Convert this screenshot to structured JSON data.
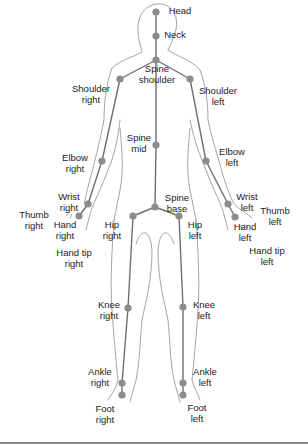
{
  "diagram": {
    "colors": {
      "joint": "#8c8c8c",
      "bone": "#6e6e6e",
      "outline": "#9a9a9a",
      "text": "#222222"
    },
    "joints": [
      {
        "id": "head",
        "label": "Head",
        "x": 156,
        "y": 12
      },
      {
        "id": "neck",
        "label": "Neck",
        "x": 156,
        "y": 36
      },
      {
        "id": "spine_shoulder",
        "label": "Spine\nshoulder",
        "x": 156,
        "y": 60
      },
      {
        "id": "shoulder_right",
        "label": "Shoulder\nright",
        "x": 120,
        "y": 79
      },
      {
        "id": "shoulder_left",
        "label": "Shoulder\nleft",
        "x": 190,
        "y": 79
      },
      {
        "id": "spine_mid",
        "label": "Spine\nmid",
        "x": 156,
        "y": 145
      },
      {
        "id": "elbow_right",
        "label": "Elbow\nright",
        "x": 102,
        "y": 161
      },
      {
        "id": "elbow_left",
        "label": "Elbow\nleft",
        "x": 206,
        "y": 161
      },
      {
        "id": "wrist_right",
        "label": "Wrist\nright",
        "x": 88,
        "y": 204
      },
      {
        "id": "wrist_left",
        "label": "Wrist\nleft",
        "x": 228,
        "y": 204
      },
      {
        "id": "hand_right",
        "label": "Hand\nright",
        "x": 79,
        "y": 216
      },
      {
        "id": "hand_left",
        "label": "Hand\nleft",
        "x": 235,
        "y": 217
      },
      {
        "id": "spine_base",
        "label": "Spine\nbase",
        "x": 155,
        "y": 207
      },
      {
        "id": "hip_right",
        "label": "Hip\nright",
        "x": 133,
        "y": 216
      },
      {
        "id": "hip_left",
        "label": "Hip\nleft",
        "x": 179,
        "y": 216
      },
      {
        "id": "knee_right",
        "label": "Knee\nright",
        "x": 128,
        "y": 308
      },
      {
        "id": "knee_left",
        "label": "Knee\nleft",
        "x": 183,
        "y": 307
      },
      {
        "id": "ankle_right",
        "label": "Ankle\nright",
        "x": 122,
        "y": 383
      },
      {
        "id": "ankle_left",
        "label": "Ankle\nleft",
        "x": 183,
        "y": 383
      },
      {
        "id": "foot_right",
        "label": "Foot\nright",
        "x": 122,
        "y": 395
      },
      {
        "id": "foot_left",
        "label": "Foot\nleft",
        "x": 183,
        "y": 395
      }
    ],
    "labels": [
      {
        "id": "head",
        "text": "Head",
        "x": 180,
        "y": 6
      },
      {
        "id": "neck",
        "text": "Neck",
        "x": 175,
        "y": 30
      },
      {
        "id": "shoulder_right",
        "text": "Shoulder\nright",
        "x": 91,
        "y": 84
      },
      {
        "id": "spine_shoulder",
        "text": "Spine\nshoulder",
        "x": 157,
        "y": 64
      },
      {
        "id": "shoulder_left",
        "text": "Shoulder\nleft",
        "x": 218,
        "y": 86
      },
      {
        "id": "spine_mid",
        "text": "Spine\nmid",
        "x": 139,
        "y": 133
      },
      {
        "id": "elbow_right",
        "text": "Elbow\nright",
        "x": 75,
        "y": 153
      },
      {
        "id": "elbow_left",
        "text": "Elbow\nleft",
        "x": 232,
        "y": 147
      },
      {
        "id": "wrist_right",
        "text": "Wrist\nright",
        "x": 69,
        "y": 192
      },
      {
        "id": "wrist_left",
        "text": "Wrist\nleft",
        "x": 247,
        "y": 192
      },
      {
        "id": "thumb_right",
        "text": "Thumb\nright",
        "x": 34,
        "y": 210
      },
      {
        "id": "thumb_left",
        "text": "Thumb\nleft",
        "x": 275,
        "y": 206
      },
      {
        "id": "hand_right",
        "text": "Hand\nright",
        "x": 65,
        "y": 220
      },
      {
        "id": "hand_left",
        "text": "Hand\nleft",
        "x": 245,
        "y": 222
      },
      {
        "id": "hand_tip_right",
        "text": "Hand tip\nright",
        "x": 74,
        "y": 248
      },
      {
        "id": "hand_tip_left",
        "text": "Hand tip\nleft",
        "x": 267,
        "y": 246
      },
      {
        "id": "spine_base",
        "text": "Spine\nbase",
        "x": 177,
        "y": 193
      },
      {
        "id": "hip_right",
        "text": "Hip\nright",
        "x": 112,
        "y": 220
      },
      {
        "id": "hip_left",
        "text": "Hip\nleft",
        "x": 195,
        "y": 220
      },
      {
        "id": "knee_right",
        "text": "Knee\nright",
        "x": 109,
        "y": 300
      },
      {
        "id": "knee_left",
        "text": "Knee\nleft",
        "x": 204,
        "y": 300
      },
      {
        "id": "ankle_right",
        "text": "Ankle\nright",
        "x": 100,
        "y": 367
      },
      {
        "id": "ankle_left",
        "text": "Ankle\nleft",
        "x": 205,
        "y": 367
      },
      {
        "id": "foot_right",
        "text": "Foot\nright",
        "x": 105,
        "y": 404
      },
      {
        "id": "foot_left",
        "text": "Foot\nleft",
        "x": 197,
        "y": 403
      }
    ],
    "bones": [
      [
        "head",
        "neck"
      ],
      [
        "neck",
        "spine_shoulder"
      ],
      [
        "spine_shoulder",
        "shoulder_right"
      ],
      [
        "spine_shoulder",
        "shoulder_left"
      ],
      [
        "spine_shoulder",
        "spine_mid"
      ],
      [
        "spine_mid",
        "spine_base"
      ],
      [
        "shoulder_right",
        "elbow_right"
      ],
      [
        "elbow_right",
        "wrist_right"
      ],
      [
        "wrist_right",
        "hand_right"
      ],
      [
        "shoulder_left",
        "elbow_left"
      ],
      [
        "elbow_left",
        "wrist_left"
      ],
      [
        "wrist_left",
        "hand_left"
      ],
      [
        "spine_base",
        "hip_right"
      ],
      [
        "spine_base",
        "hip_left"
      ],
      [
        "hip_right",
        "knee_right"
      ],
      [
        "knee_right",
        "ankle_right"
      ],
      [
        "ankle_right",
        "foot_right"
      ],
      [
        "hip_left",
        "knee_left"
      ],
      [
        "knee_left",
        "ankle_left"
      ],
      [
        "ankle_left",
        "foot_left"
      ]
    ]
  }
}
